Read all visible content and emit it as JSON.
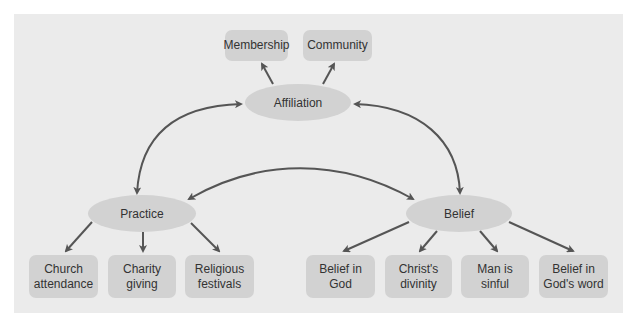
{
  "diagram": {
    "center": {
      "affiliation": {
        "label": "Affiliation"
      },
      "practice": {
        "label": "Practice"
      },
      "belief": {
        "label": "Belief"
      }
    },
    "affiliation_children": [
      {
        "label": "Membership"
      },
      {
        "label": "Community"
      }
    ],
    "practice_children": [
      {
        "label": "Church\nattendance"
      },
      {
        "label": "Charity\ngiving"
      },
      {
        "label": "Religious\nfestivals"
      }
    ],
    "belief_children": [
      {
        "label": "Belief in\nGod"
      },
      {
        "label": "Christ's\ndivinity"
      },
      {
        "label": "Man is\nsinful"
      },
      {
        "label": "Belief in\nGod's word"
      }
    ],
    "edges": [
      {
        "from": "Affiliation",
        "to": "Membership",
        "type": "directed"
      },
      {
        "from": "Affiliation",
        "to": "Community",
        "type": "directed"
      },
      {
        "from": "Affiliation",
        "to": "Practice",
        "type": "bidirectional"
      },
      {
        "from": "Affiliation",
        "to": "Belief",
        "type": "bidirectional"
      },
      {
        "from": "Practice",
        "to": "Belief",
        "type": "bidirectional"
      },
      {
        "from": "Practice",
        "to": "Church attendance",
        "type": "directed"
      },
      {
        "from": "Practice",
        "to": "Charity giving",
        "type": "directed"
      },
      {
        "from": "Practice",
        "to": "Religious festivals",
        "type": "directed"
      },
      {
        "from": "Belief",
        "to": "Belief in God",
        "type": "directed"
      },
      {
        "from": "Belief",
        "to": "Christ's divinity",
        "type": "directed"
      },
      {
        "from": "Belief",
        "to": "Man is sinful",
        "type": "directed"
      },
      {
        "from": "Belief",
        "to": "Belief in God's word",
        "type": "directed"
      }
    ],
    "colors": {
      "panel": "#ebebeb",
      "node": "#d2d2d2",
      "arrow": "#555555",
      "text": "#333333"
    }
  }
}
